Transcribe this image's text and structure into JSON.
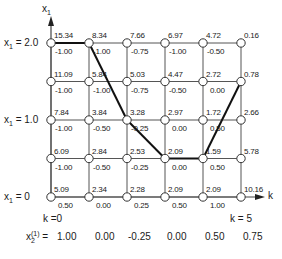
{
  "axes": {
    "y_axis_label": "x",
    "y_axis_sub": "1",
    "x_axis_label": "k",
    "row_labels": [
      {
        "text": "x",
        "sub": "1",
        "value": " = 2.0"
      },
      {
        "text": "x",
        "sub": "1",
        "value": " = 1.0"
      },
      {
        "text": "x",
        "sub": "1",
        "value": " = 0"
      }
    ]
  },
  "stage_labels": {
    "first": "k =0",
    "last": "k = 5"
  },
  "footer": {
    "label_main": "x",
    "label_sub": "2",
    "label_sup": "(1)",
    "label_eq": " = ",
    "values": [
      "1.00",
      "0.00",
      "-0.25",
      "0.00",
      "0.50",
      "0.75"
    ]
  },
  "grid": {
    "x_levels": [
      "2.0",
      "1.5",
      "1.0",
      "0.5",
      "0"
    ],
    "stages": [
      0,
      1,
      2,
      3,
      4,
      5
    ],
    "nodes": [
      [
        {
          "cost": "15.34",
          "control": "-1.00"
        },
        {
          "cost": "8.34",
          "control": "-1.00"
        },
        {
          "cost": "7.66",
          "control": "-0.75"
        },
        {
          "cost": "6.97",
          "control": "-1.00"
        },
        {
          "cost": "4.72",
          "control": "-0.50"
        },
        {
          "cost": "0.16",
          "control": ""
        }
      ],
      [
        {
          "cost": "11.09",
          "control": "-1.00"
        },
        {
          "cost": "5.84",
          "control": "-1.00"
        },
        {
          "cost": "5.03",
          "control": "-0.75"
        },
        {
          "cost": "4.47",
          "control": "-0.50"
        },
        {
          "cost": "2.72",
          "control": "0.00"
        },
        {
          "cost": "0.78",
          "control": ""
        }
      ],
      [
        {
          "cost": "7.84",
          "control": "-1.00"
        },
        {
          "cost": "3.84",
          "control": "-0.50"
        },
        {
          "cost": "3.28",
          "control": "-0.25"
        },
        {
          "cost": "2.97",
          "control": "0.00"
        },
        {
          "cost": "1.72",
          "control": "0.50"
        },
        {
          "cost": "2.66",
          "control": ""
        }
      ],
      [
        {
          "cost": "6.09",
          "control": "-1.00"
        },
        {
          "cost": "2.84",
          "control": "-0.50"
        },
        {
          "cost": "2.53",
          "control": "-0.25"
        },
        {
          "cost": "2.09",
          "control": "0.00"
        },
        {
          "cost": "1.59",
          "control": "0.50"
        },
        {
          "cost": "5.78",
          "control": ""
        }
      ],
      [
        {
          "cost": "5.09",
          "control": "0.50"
        },
        {
          "cost": "2.34",
          "control": "0.00"
        },
        {
          "cost": "2.28",
          "control": "0.25"
        },
        {
          "cost": "2.09",
          "control": "0.50"
        },
        {
          "cost": "2.09",
          "control": "1.00"
        },
        {
          "cost": "10.16",
          "control": ""
        }
      ]
    ],
    "optimal_path": [
      [
        0,
        0
      ],
      [
        1,
        0
      ],
      [
        2,
        2
      ],
      [
        3,
        3
      ],
      [
        4,
        3
      ],
      [
        5,
        1
      ]
    ]
  },
  "colors": {
    "grid_line": "#555555",
    "path_line": "#111111",
    "node_fill": "#ffffff",
    "text": "#1a1a1a"
  }
}
